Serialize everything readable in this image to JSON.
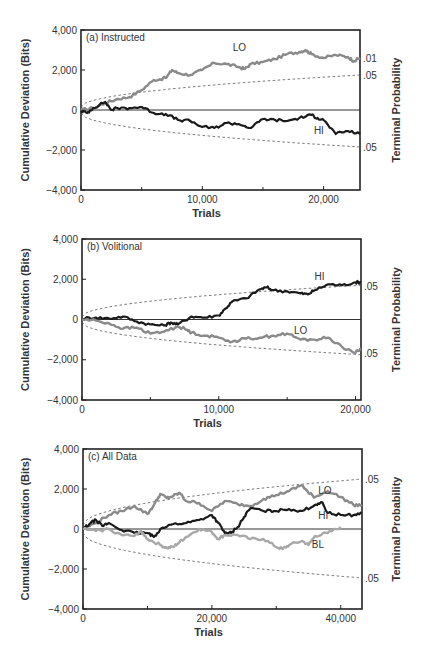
{
  "figure": {
    "y_axis_title": "Cumulative Deviation (Bits)",
    "right_axis_title": "Terminal Probability",
    "x_axis_title": "Trials"
  },
  "chart_data": [
    {
      "type": "line",
      "title": "(a) Instructed",
      "xlabel": "Trials",
      "ylabel": "Cumulative Deviation (Bits)",
      "right_label": "Terminal Probability",
      "xlim": [
        0,
        23000
      ],
      "ylim": [
        -4000,
        4000
      ],
      "xticks": [
        0,
        10000,
        20000
      ],
      "xtick_labels": [
        "0",
        "10,000",
        "20,000"
      ],
      "yticks": [
        4000,
        2000,
        0,
        -2000,
        -4000
      ],
      "ytick_labels": [
        "4,000",
        "2,000",
        "0",
        "−2,000",
        "−4,000"
      ],
      "minor_xticks": [
        5000,
        15000
      ],
      "prob_labels": [
        {
          "text": ".01",
          "y": 2600
        },
        {
          "text": ".05",
          "y": 1750
        },
        {
          "text": ".05",
          "y": -1850
        }
      ],
      "envelope": {
        "upper_end": 1750,
        "lower_end": -1850,
        "style": "dashed"
      },
      "series": [
        {
          "name": "LO",
          "color": "#8a8a8a",
          "label_pos": [
            12500,
            3100
          ],
          "x": [
            0,
            1000,
            2000,
            3000,
            4000,
            5000,
            6000,
            7000,
            7500,
            8000,
            9000,
            10000,
            11000,
            12000,
            13000,
            13500,
            14000,
            15000,
            16000,
            17000,
            18000,
            18500,
            19000,
            20000,
            21000,
            22000,
            22500,
            23000
          ],
          "values": [
            0,
            100,
            350,
            550,
            650,
            1000,
            1500,
            1600,
            2000,
            1850,
            1750,
            2000,
            2350,
            2300,
            2150,
            2050,
            2300,
            2400,
            2550,
            2800,
            2900,
            3000,
            2800,
            2600,
            2750,
            2650,
            2450,
            2600
          ]
        },
        {
          "name": "HI",
          "color": "#1a1a1a",
          "label_pos": [
            19200,
            -1050
          ],
          "x": [
            0,
            500,
            1000,
            2000,
            2500,
            3000,
            4000,
            5000,
            6000,
            7000,
            8000,
            9000,
            10000,
            11000,
            12000,
            13000,
            14000,
            15000,
            16000,
            17000,
            18000,
            19000,
            19500,
            20000,
            21000,
            22000,
            23000
          ],
          "values": [
            -50,
            -150,
            100,
            400,
            0,
            100,
            100,
            150,
            -150,
            -200,
            -500,
            -550,
            -850,
            -900,
            -650,
            -700,
            -900,
            -450,
            -500,
            -550,
            -400,
            -250,
            -400,
            -500,
            -1200,
            -1050,
            -1200
          ]
        }
      ]
    },
    {
      "type": "line",
      "title": "(b) Volitional",
      "xlabel": "Trials",
      "ylabel": "Cumulative Deviation (Bits)",
      "right_label": "Terminal Probability",
      "xlim": [
        0,
        20400
      ],
      "ylim": [
        -4000,
        4000
      ],
      "xticks": [
        0,
        10000,
        20000
      ],
      "xtick_labels": [
        "0",
        "10,000",
        "20,000"
      ],
      "yticks": [
        4000,
        2000,
        0,
        -2000,
        -4000
      ],
      "ytick_labels": [
        "4,000",
        "2,000",
        "0",
        "−2,000",
        "−4,000"
      ],
      "minor_xticks": [
        5000,
        15000
      ],
      "prob_labels": [
        {
          "text": ".05",
          "y": 1650
        },
        {
          "text": ".05",
          "y": -1700
        }
      ],
      "envelope": {
        "upper_end": 1700,
        "lower_end": -1750,
        "style": "dashed"
      },
      "series": [
        {
          "name": "HI",
          "color": "#1a1a1a",
          "label_pos": [
            17000,
            2100
          ],
          "x": [
            0,
            1000,
            2000,
            3000,
            4000,
            5000,
            6000,
            6500,
            7000,
            8000,
            9000,
            10000,
            10500,
            11000,
            12000,
            13000,
            13500,
            14000,
            15000,
            16000,
            16500,
            17000,
            18000,
            19000,
            20000,
            20400
          ],
          "values": [
            50,
            100,
            50,
            150,
            -100,
            -250,
            -300,
            -150,
            -250,
            150,
            100,
            200,
            550,
            900,
            1050,
            1500,
            1600,
            1450,
            1400,
            1300,
            1250,
            1450,
            1750,
            1700,
            1850,
            1850
          ]
        },
        {
          "name": "LO",
          "color": "#8a8a8a",
          "label_pos": [
            15500,
            -550
          ],
          "x": [
            0,
            1000,
            2000,
            3000,
            4000,
            5000,
            6000,
            7000,
            7500,
            8000,
            9000,
            10000,
            11000,
            12000,
            13000,
            14000,
            15000,
            16000,
            17000,
            18000,
            19000,
            20000,
            20400
          ],
          "values": [
            0,
            -50,
            -200,
            -450,
            -400,
            -700,
            -600,
            -350,
            -450,
            -650,
            -800,
            -900,
            -1100,
            -950,
            -900,
            -800,
            -700,
            -1000,
            -1000,
            -900,
            -1350,
            -1650,
            -1450
          ]
        }
      ]
    },
    {
      "type": "line",
      "title": "(c) All Data",
      "xlabel": "Trials",
      "ylabel": "Cumulative Deviation (Bits)",
      "right_label": "Terminal Probability",
      "xlim": [
        0,
        43300
      ],
      "ylim": [
        -4000,
        4000
      ],
      "xticks": [
        0,
        20000,
        40000
      ],
      "xtick_labels": [
        "0",
        "20,000",
        "40,000"
      ],
      "yticks": [
        4000,
        2000,
        0,
        -2000,
        -4000
      ],
      "ytick_labels": [
        "4,000",
        "2,000",
        "0",
        "−2,000",
        "−4,000"
      ],
      "minor_xticks": [
        10000,
        30000
      ],
      "prob_labels": [
        {
          "text": ".05",
          "y": 2500
        },
        {
          "text": ".05",
          "y": -2450
        }
      ],
      "envelope": {
        "upper_end": 2500,
        "lower_end": -2450,
        "style": "dashed"
      },
      "series": [
        {
          "name": "LO",
          "color": "#8a8a8a",
          "label_pos": [
            36500,
            1900
          ],
          "x": [
            0,
            2000,
            4000,
            6000,
            8000,
            10000,
            11000,
            12000,
            13000,
            14000,
            15000,
            16000,
            18000,
            20000,
            22000,
            24000,
            26000,
            28000,
            30000,
            32000,
            34000,
            35000,
            36000,
            38000,
            40000,
            42000,
            43300
          ],
          "values": [
            0,
            300,
            700,
            900,
            1150,
            750,
            1200,
            1750,
            1550,
            1650,
            1800,
            1400,
            1300,
            900,
            1400,
            1250,
            1150,
            1500,
            1700,
            1900,
            2200,
            1800,
            1600,
            1900,
            1600,
            1200,
            1200
          ]
        },
        {
          "name": "HI",
          "color": "#1a1a1a",
          "label_pos": [
            36500,
            650
          ],
          "x": [
            0,
            1000,
            2000,
            3000,
            4000,
            6000,
            8000,
            10000,
            11000,
            12000,
            14000,
            16000,
            18000,
            20000,
            21000,
            22000,
            23000,
            24000,
            25000,
            26000,
            28000,
            30000,
            32000,
            34000,
            36000,
            37000,
            38000,
            40000,
            42000,
            43300
          ],
          "values": [
            0,
            250,
            450,
            150,
            300,
            -50,
            -200,
            -200,
            -400,
            0,
            250,
            300,
            450,
            700,
            300,
            -200,
            -200,
            100,
            600,
            1050,
            900,
            900,
            1000,
            900,
            1200,
            1350,
            800,
            700,
            700,
            800
          ]
        },
        {
          "name": "BL",
          "color": "#a8a8a8",
          "label_pos": [
            35500,
            -800
          ],
          "x": [
            0,
            2000,
            4000,
            6000,
            8000,
            9000,
            10000,
            12000,
            13000,
            14000,
            15000,
            16000,
            18000,
            20000,
            21000,
            22000,
            24000,
            26000,
            28000,
            30000,
            31000,
            32000,
            34000,
            35000,
            36000,
            38000,
            40000
          ],
          "values": [
            0,
            -100,
            0,
            -300,
            -350,
            -100,
            -500,
            -800,
            -950,
            -900,
            -650,
            -400,
            0,
            -150,
            -500,
            -300,
            -300,
            -500,
            -500,
            -900,
            -1000,
            -800,
            -600,
            -800,
            -350,
            -200,
            100
          ]
        }
      ]
    }
  ],
  "panels_layout": [
    {
      "left": 81,
      "right": 360,
      "top": 30,
      "bottom": 190
    },
    {
      "left": 82,
      "right": 361,
      "top": 239,
      "bottom": 400
    },
    {
      "left": 83,
      "right": 362,
      "top": 449,
      "bottom": 609
    }
  ]
}
